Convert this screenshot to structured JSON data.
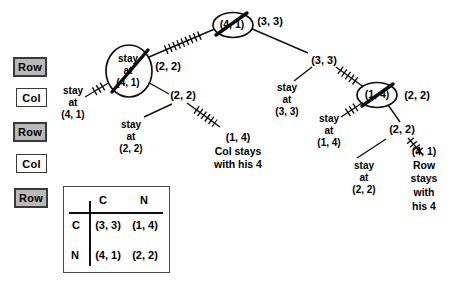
{
  "move_sequence": [
    "Row",
    "Col",
    "Row",
    "Col",
    "Row"
  ],
  "tree": {
    "root": {
      "payoff": "(4, 1)",
      "alt_payoff": "(3, 3)"
    },
    "left": {
      "oval": "stay\nat\n(4, 1)",
      "stay_root": "stay\nat\n(4, 1)",
      "alt_payoff": "(2, 2)",
      "node": "(2, 2)",
      "stay_node": "stay\nat\n(2, 2)",
      "deviation": "(1, 4)\nCol stays\nwith his 4"
    },
    "right": {
      "node33": "(3, 3)",
      "stay33": "stay\nat\n(3, 3)",
      "oval": "(1, 4)",
      "alt_payoff": "(2, 2)",
      "stay14": "stay\nat\n(1, 4)",
      "node22": "(2, 2)",
      "stay22": "stay\nat\n(2, 2)",
      "deviation": "(4, 1)\nRow stays\nwith his 4"
    }
  },
  "payoff_matrix": {
    "col_headers": [
      "C",
      "N"
    ],
    "row_headers": [
      "C",
      "N"
    ],
    "cells": [
      [
        "(3, 3)",
        "(1, 4)"
      ],
      [
        "(4, 1)",
        "(2, 2)"
      ]
    ]
  },
  "colors": {
    "shaded_box": "#b9b9b9",
    "ink": "#000000",
    "background": "#ffffff"
  }
}
